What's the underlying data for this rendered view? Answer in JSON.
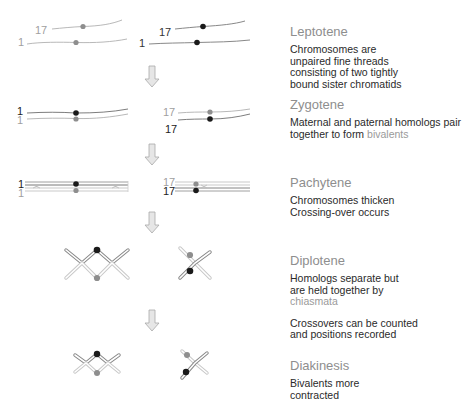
{
  "colors": {
    "maternal": "#999999",
    "paternal": "#1f1f1f",
    "thread_light": "#b8b8b8",
    "thread_dark": "#7a7a7a",
    "title": "#8e8e8e",
    "text": "#2a2a2a",
    "highlight": "#9a9a9a",
    "arrow": "#bdbdbd"
  },
  "diagram": {
    "labels": {
      "chr1": "1",
      "chr17": "17"
    },
    "arrow_icon": "down-arrow"
  },
  "stages": [
    {
      "title": "Leptotene",
      "desc": [
        {
          "parts": [
            {
              "text": "Chromosomes are unpaired fine threads consisting of two tightly bound sister chromatids",
              "hl": false
            }
          ]
        }
      ]
    },
    {
      "title": "Zygotene",
      "desc": [
        {
          "parts": [
            {
              "text": "Maternal and paternal homologs pair together to form ",
              "hl": false
            },
            {
              "text": "bivalents",
              "hl": true
            }
          ]
        }
      ]
    },
    {
      "title": "Pachytene",
      "desc": [
        {
          "parts": [
            {
              "text": "Chromosomes thicken",
              "hl": false
            }
          ]
        },
        {
          "parts": [
            {
              "text": "Crossing-over occurs",
              "hl": false
            }
          ]
        }
      ]
    },
    {
      "title": "Diplotene",
      "desc": [
        {
          "parts": [
            {
              "text": "Homologs separate but are held together by ",
              "hl": false
            },
            {
              "text": "chiasmata",
              "hl": true
            }
          ]
        },
        {
          "parts": [
            {
              "text": "Crossovers can be counted and positions recorded",
              "hl": false
            }
          ]
        }
      ]
    },
    {
      "title": "Diakinesis",
      "desc": [
        {
          "parts": [
            {
              "text": "Bivalents more contracted",
              "hl": false
            }
          ]
        }
      ]
    }
  ]
}
